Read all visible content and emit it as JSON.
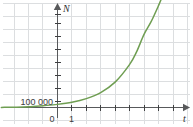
{
  "chart_data": {
    "type": "line",
    "title": "",
    "subtitle": "",
    "xlabel": "t",
    "ylabel": "N",
    "grid": true,
    "legend": false,
    "xlim": [
      -3.9,
      9.4
    ],
    "ylim": [
      -70000,
      850000
    ],
    "x_ticks": [
      1,
      2,
      3,
      4,
      5,
      6,
      7,
      8,
      9
    ],
    "x_tick_labels": [
      "1",
      "",
      "",
      "",
      "",
      "",
      "",
      "",
      ""
    ],
    "y_ticks": [
      100000,
      200000,
      300000,
      400000,
      500000,
      600000,
      700000,
      800000
    ],
    "y_tick_labels": [
      "100 000",
      "",
      "",
      "",
      "",
      "",
      "",
      ""
    ],
    "origin_label": "0",
    "series": [
      {
        "name": "exponential growth",
        "color": "#6f9e52",
        "x": [
          -3.9,
          -3.0,
          -2.0,
          -1.0,
          0.0,
          1.0,
          2.0,
          3.0,
          4.0,
          5.0,
          5.5,
          6.0,
          6.5,
          7.0,
          7.3
        ],
        "values": [
          800,
          1900,
          5200,
          14000,
          24000,
          40000,
          68000,
          115000,
          195000,
          330000,
          430000,
          560000,
          660000,
          780000,
          860000
        ]
      }
    ],
    "annotations": []
  },
  "axes": {
    "y_axis_name": "N",
    "x_axis_name": "t",
    "origin_label": "0",
    "y_first_tick_label": "100 000",
    "x_first_tick_label": "1"
  },
  "colors": {
    "curve": "#6f9e52",
    "grid": "#dcdee0",
    "axis": "#58595b",
    "text": "#3b3c3e",
    "background": "#ffffff"
  }
}
